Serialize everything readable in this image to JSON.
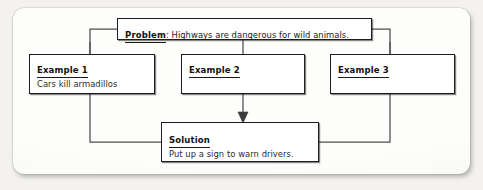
{
  "diagram": {
    "type": "problem-solution graphic organizer",
    "nodes": {
      "problem": {
        "label": "Problem",
        "separator": ": ",
        "text": "Highways are dangerous for wild animals."
      },
      "example1": {
        "label": "Example 1",
        "text": "Cars kill armadillos"
      },
      "example2": {
        "label": "Example 2",
        "text": ""
      },
      "example3": {
        "label": "Example 3",
        "text": ""
      },
      "solution": {
        "label": "Solution",
        "text": "Put up a sign to warn drivers."
      }
    },
    "connectors": {
      "arrow_direction": "down",
      "arrow_from": "Example 2",
      "arrow_to": "Solution"
    },
    "colors": {
      "page_background": "#f3f2f0",
      "card_background": "#fdfdfb",
      "box_fill": "#ffffff",
      "ink": "#1d1d1d",
      "line": "#4a4a4a"
    }
  }
}
